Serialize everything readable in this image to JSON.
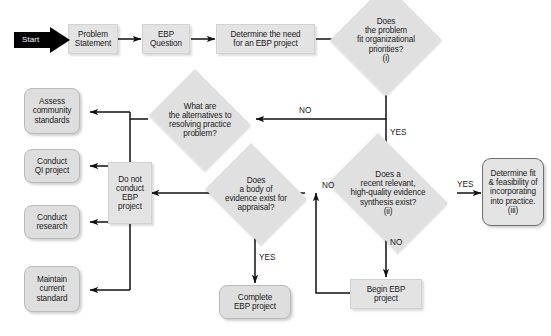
{
  "diagram": {
    "colors": {
      "node_fill": "#e0e0e0",
      "node_border": "#b9b9b9",
      "strong_border": "#6f6f6f",
      "line": "#111111",
      "start_fill": "#000000",
      "start_text": "#ffffff",
      "text": "#1a1a1a"
    },
    "nodes": {
      "start": {
        "label": "Start",
        "shape": "arrow-pennant"
      },
      "problem_statement": {
        "label": "Problem\nStatement",
        "shape": "process"
      },
      "ebp_question": {
        "label": "EBP\nQuestion",
        "shape": "process"
      },
      "determine_need": {
        "label": "Determine the need\nfor an EBP project",
        "shape": "process"
      },
      "fit_priorities": {
        "label": "Does\nthe problem\nfit organizational\npriorities?\n(i)",
        "shape": "decision"
      },
      "alternatives": {
        "label": "What are\nthe alternatives to\nresolving practice\nproblem?",
        "shape": "decision"
      },
      "body_of_evidence": {
        "label": "Does\na body of\nevidence exist for\nappraisal?",
        "shape": "decision"
      },
      "evidence_synthesis": {
        "label": "Does a\nrecent relevant,\nhigh-quality evidence\nsynthesis exist?\n(ii)",
        "shape": "decision"
      },
      "determine_fit": {
        "label": "Determine fit\n& feasibility of\nincorporating\ninto practice.\n(iii)",
        "shape": "terminator"
      },
      "do_not_conduct": {
        "label": "Do not\nconduct\nEBP\nproject",
        "shape": "process"
      },
      "assess_community": {
        "label": "Assess\ncommunity\nstandards",
        "shape": "terminator"
      },
      "conduct_qi": {
        "label": "Conduct\nQI project",
        "shape": "terminator"
      },
      "conduct_research": {
        "label": "Conduct\nresearch",
        "shape": "terminator"
      },
      "maintain_standard": {
        "label": "Maintain\ncurrent\nstandard",
        "shape": "terminator"
      },
      "complete_ebp": {
        "label": "Complete\nEBP project",
        "shape": "terminator"
      },
      "begin_ebp": {
        "label": "Begin EBP\nproject",
        "shape": "process"
      }
    },
    "edge_labels": {
      "fit_no": "NO",
      "fit_yes": "YES",
      "synthesis_yes": "YES",
      "synthesis_no": "NO",
      "evidence_no": "NO",
      "evidence_yes": "YES"
    },
    "edges": [
      {
        "from": "start",
        "to": "problem_statement",
        "label": ""
      },
      {
        "from": "problem_statement",
        "to": "ebp_question",
        "label": ""
      },
      {
        "from": "ebp_question",
        "to": "determine_need",
        "label": ""
      },
      {
        "from": "determine_need",
        "to": "fit_priorities",
        "label": ""
      },
      {
        "from": "fit_priorities",
        "to": "alternatives",
        "label": "NO"
      },
      {
        "from": "fit_priorities",
        "to": "evidence_synthesis",
        "label": "YES"
      },
      {
        "from": "alternatives",
        "to": "assess_community",
        "label": ""
      },
      {
        "from": "evidence_synthesis",
        "to": "determine_fit",
        "label": "YES"
      },
      {
        "from": "evidence_synthesis",
        "to": "begin_ebp",
        "label": "NO"
      },
      {
        "from": "begin_ebp",
        "to": "body_of_evidence",
        "label": ""
      },
      {
        "from": "body_of_evidence",
        "to": "do_not_conduct",
        "label": "NO"
      },
      {
        "from": "body_of_evidence",
        "to": "complete_ebp",
        "label": "YES"
      },
      {
        "from": "do_not_conduct",
        "to": "assess_community",
        "label": ""
      },
      {
        "from": "do_not_conduct",
        "to": "conduct_qi",
        "label": ""
      },
      {
        "from": "do_not_conduct",
        "to": "conduct_research",
        "label": ""
      },
      {
        "from": "do_not_conduct",
        "to": "maintain_standard",
        "label": ""
      }
    ]
  }
}
